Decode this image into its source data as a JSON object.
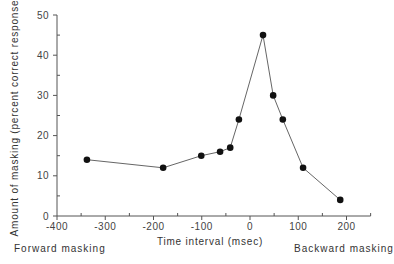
{
  "chart_data": {
    "type": "line",
    "title": "",
    "xlabel": "Time interval (msec)",
    "ylabel": "Amount of masking (percent correct response)",
    "xlim": [
      -400,
      250
    ],
    "ylim": [
      0,
      50
    ],
    "x_ticks": [
      -400,
      -300,
      -200,
      -100,
      0,
      100,
      200
    ],
    "y_ticks": [
      0,
      10,
      20,
      30,
      40,
      50
    ],
    "grid": false,
    "legend": null,
    "series": [
      {
        "name": "Masking",
        "x": [
          -338,
          -180,
          -101,
          -62,
          -41,
          -23,
          27,
          48,
          68,
          110,
          187
        ],
        "y": [
          14,
          12,
          15,
          16,
          17,
          24,
          45,
          30,
          24,
          12,
          4
        ]
      }
    ],
    "annotations": [
      "Forward masking",
      "Backward masking"
    ]
  },
  "labels": {
    "forward": "Forward masking",
    "backward": "Backward masking"
  }
}
